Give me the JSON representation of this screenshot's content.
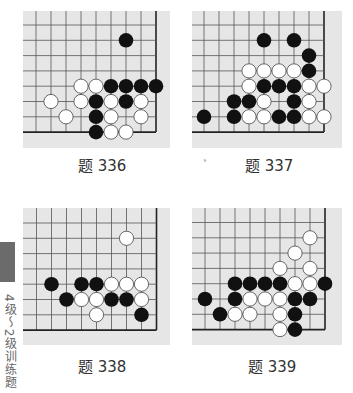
{
  "section_tab": {
    "text": "4级～2级训练题",
    "color": "#6b6b6b"
  },
  "style": {
    "board_bg": "#e6e6e6",
    "grid_color": "#555555",
    "edge_color": "#222222",
    "black_stone": "#111111",
    "white_stone": "#ffffff",
    "white_outline": "#444444"
  },
  "problems": [
    {
      "label": "题 336",
      "cols": 9,
      "rows": 8,
      "edges": [
        "right",
        "bottom"
      ],
      "stones": {
        "black": [
          [
            6,
            1
          ],
          [
            5,
            4
          ],
          [
            6,
            4
          ],
          [
            7,
            4
          ],
          [
            8,
            4
          ],
          [
            4,
            5
          ],
          [
            6,
            5
          ],
          [
            4,
            6
          ],
          [
            4,
            7
          ]
        ],
        "white": [
          [
            3,
            4
          ],
          [
            4,
            4
          ],
          [
            1,
            5
          ],
          [
            3,
            5
          ],
          [
            5,
            5
          ],
          [
            7,
            5
          ],
          [
            2,
            6
          ],
          [
            5,
            6
          ],
          [
            7,
            6
          ],
          [
            5,
            7
          ],
          [
            6,
            7
          ]
        ]
      }
    },
    {
      "label": "题 337",
      "cols": 9,
      "rows": 8,
      "edges": [
        "right",
        "bottom"
      ],
      "stones": {
        "black": [
          [
            4,
            1
          ],
          [
            6,
            1
          ],
          [
            7,
            2
          ],
          [
            7,
            3
          ],
          [
            4,
            4
          ],
          [
            5,
            4
          ],
          [
            6,
            4
          ],
          [
            2,
            5
          ],
          [
            3,
            5
          ],
          [
            6,
            5
          ],
          [
            0,
            6
          ],
          [
            2,
            6
          ],
          [
            5,
            6
          ],
          [
            6,
            6
          ]
        ],
        "white": [
          [
            3,
            3
          ],
          [
            4,
            3
          ],
          [
            5,
            3
          ],
          [
            6,
            3
          ],
          [
            3,
            4
          ],
          [
            7,
            4
          ],
          [
            8,
            4
          ],
          [
            4,
            5
          ],
          [
            7,
            5
          ],
          [
            3,
            6
          ],
          [
            4,
            6
          ],
          [
            7,
            6
          ],
          [
            8,
            6
          ]
        ]
      }
    },
    {
      "label": "题 338",
      "cols": 9,
      "rows": 8,
      "edges": [
        "right",
        "bottom"
      ],
      "stones": {
        "black": [
          [
            1,
            4
          ],
          [
            3,
            4
          ],
          [
            4,
            4
          ],
          [
            2,
            5
          ],
          [
            5,
            5
          ],
          [
            6,
            5
          ],
          [
            7,
            6
          ]
        ],
        "white": [
          [
            6,
            1
          ],
          [
            5,
            4
          ],
          [
            6,
            4
          ],
          [
            7,
            4
          ],
          [
            3,
            5
          ],
          [
            4,
            5
          ],
          [
            7,
            5
          ],
          [
            4,
            6
          ]
        ]
      }
    },
    {
      "label": "题 339",
      "cols": 9,
      "rows": 8,
      "edges": [
        "right",
        "bottom"
      ],
      "stones": {
        "black": [
          [
            2,
            4
          ],
          [
            3,
            4
          ],
          [
            4,
            4
          ],
          [
            5,
            4
          ],
          [
            8,
            4
          ],
          [
            0,
            5
          ],
          [
            2,
            5
          ],
          [
            6,
            5
          ],
          [
            7,
            5
          ],
          [
            1,
            6
          ],
          [
            6,
            6
          ],
          [
            6,
            7
          ]
        ],
        "white": [
          [
            7,
            1
          ],
          [
            6,
            2
          ],
          [
            5,
            3
          ],
          [
            7,
            3
          ],
          [
            6,
            4
          ],
          [
            7,
            4
          ],
          [
            3,
            5
          ],
          [
            4,
            5
          ],
          [
            5,
            5
          ],
          [
            2,
            6
          ],
          [
            3,
            6
          ],
          [
            5,
            6
          ],
          [
            5,
            7
          ]
        ]
      }
    }
  ]
}
